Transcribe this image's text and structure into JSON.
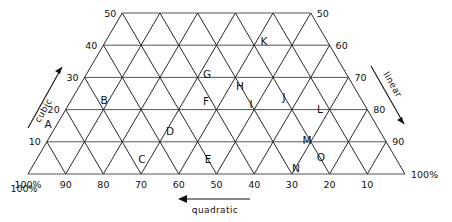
{
  "figure": {
    "type": "ternary-trapezoid-grid",
    "title": "",
    "background": "#ffffff",
    "line_color": "#2a2a2a"
  },
  "axes": {
    "left": {
      "name": "cubic",
      "direction": "up-right",
      "ticks": [
        "50",
        "40",
        "30",
        "20",
        "10",
        "100%"
      ]
    },
    "right": {
      "name": "linear",
      "direction": "down-right",
      "ticks": [
        "50",
        "60",
        "70",
        "80",
        "90",
        "100%"
      ]
    },
    "bottom": {
      "name": "quadratic",
      "direction": "left",
      "ticks": [
        "100%",
        "90",
        "80",
        "70",
        "60",
        "50",
        "40",
        "30",
        "20",
        "10",
        "100%"
      ]
    }
  },
  "left_ticks": [
    {
      "label": "50",
      "row": 0
    },
    {
      "label": "40",
      "row": 1
    },
    {
      "label": "30",
      "row": 2
    },
    {
      "label": "20",
      "row": 3
    },
    {
      "label": "10",
      "row": 4
    },
    {
      "label": "100%",
      "row": 5
    }
  ],
  "right_ticks": [
    {
      "label": "50",
      "row": 0
    },
    {
      "label": "60",
      "row": 1
    },
    {
      "label": "70",
      "row": 2
    },
    {
      "label": "80",
      "row": 3
    },
    {
      "label": "90",
      "row": 4
    },
    {
      "label": "100%",
      "row": 5
    }
  ],
  "bottom_ticks": [
    {
      "label": "100%",
      "col": 0
    },
    {
      "label": "90",
      "col": 1
    },
    {
      "label": "80",
      "col": 2
    },
    {
      "label": "70",
      "col": 3
    },
    {
      "label": "60",
      "col": 4
    },
    {
      "label": "50",
      "col": 5
    },
    {
      "label": "40",
      "col": 6
    },
    {
      "label": "30",
      "col": 7
    },
    {
      "label": "20",
      "col": 8
    },
    {
      "label": "10",
      "col": 9
    },
    {
      "label": "100%",
      "col": 10
    }
  ],
  "points": [
    {
      "id": "A",
      "x": 48,
      "y": 128
    },
    {
      "id": "B",
      "x": 104,
      "y": 104
    },
    {
      "id": "C",
      "x": 142,
      "y": 163
    },
    {
      "id": "D",
      "x": 170,
      "y": 135
    },
    {
      "id": "E",
      "x": 208,
      "y": 163
    },
    {
      "id": "F",
      "x": 206,
      "y": 105
    },
    {
      "id": "G",
      "x": 207,
      "y": 78
    },
    {
      "id": "H",
      "x": 240,
      "y": 90
    },
    {
      "id": "I",
      "x": 251,
      "y": 108
    },
    {
      "id": "J",
      "x": 284,
      "y": 101
    },
    {
      "id": "K",
      "x": 264,
      "y": 45
    },
    {
      "id": "L",
      "x": 320,
      "y": 113
    },
    {
      "id": "M",
      "x": 307,
      "y": 144
    },
    {
      "id": "N",
      "x": 296,
      "y": 172
    },
    {
      "id": "O",
      "x": 321,
      "y": 161
    }
  ]
}
